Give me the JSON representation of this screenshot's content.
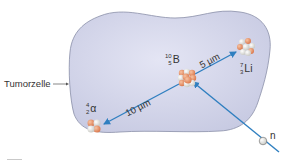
{
  "diagram": {
    "cell_label": "Tumorzelle",
    "boron": {
      "mass": "10",
      "atomic": "5",
      "symbol": "B"
    },
    "lithium": {
      "mass": "7",
      "atomic": "3",
      "symbol": "Li"
    },
    "alpha": {
      "mass": "4",
      "atomic": "2",
      "symbol": "α"
    },
    "neutron": {
      "symbol": "n"
    },
    "distance_li": "5 µm",
    "distance_alpha": "10 µm",
    "colors": {
      "cell_fill": "#d4d6ec",
      "cell_stroke": "#8a8fa8",
      "arrow": "#2f7fc0",
      "proton": "#e8956a",
      "neutron_particle": "#f2f2ee"
    }
  }
}
